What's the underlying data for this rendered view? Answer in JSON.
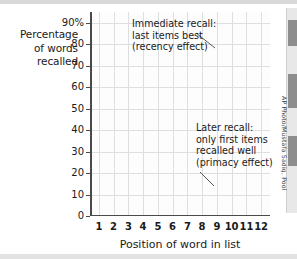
{
  "figure": {
    "y_axis_title_lines": [
      "Percentage",
      "of words",
      "recalled"
    ],
    "x_axis_title": "Position of word in list",
    "photo_credit": "AP Photo/Mustafa Sadiq, Pool"
  },
  "annotations": [
    {
      "id": "immediate",
      "lines": [
        "Immediate recall:",
        "last items best",
        "(recency effect)"
      ],
      "points_to_series": "Immediate recall"
    },
    {
      "id": "later",
      "lines": [
        "Later recall:",
        "only first items",
        "recalled well",
        "(primacy effect)"
      ],
      "points_to_series": "Later recall"
    }
  ],
  "chart_data": {
    "type": "line",
    "title": "",
    "xlabel": "Position of word in list",
    "ylabel": "Percentage of words recalled",
    "x": [
      1,
      2,
      3,
      4,
      5,
      6,
      7,
      8,
      9,
      10,
      11,
      12
    ],
    "categories": [
      "1",
      "2",
      "3",
      "4",
      "5",
      "6",
      "7",
      "8",
      "9",
      "10",
      "11",
      "12"
    ],
    "xlim": [
      0.4,
      12.6
    ],
    "ylim": [
      0,
      95
    ],
    "ytick_values": [
      0,
      10,
      20,
      30,
      40,
      50,
      60,
      70,
      80,
      90
    ],
    "ytick_labels": [
      "0",
      "10",
      "20",
      "30",
      "40",
      "50",
      "60",
      "70",
      "80",
      "90%"
    ],
    "grid": true,
    "legend": "none",
    "series": [
      {
        "name": "Immediate recall",
        "color": "#9a9a9a",
        "line_width": 5,
        "values": [
          70,
          61,
          52,
          43,
          31,
          30,
          32,
          24,
          86,
          85,
          90,
          84
        ]
      },
      {
        "name": "Later recall",
        "color": "#cccccc",
        "line_width": 5,
        "values": [
          42,
          36,
          29,
          22,
          15,
          18,
          19,
          16,
          19,
          13,
          13,
          11
        ]
      }
    ]
  },
  "colors": {
    "immediate_line": "#9a9a9a",
    "later_line": "#cccccc",
    "grid": "#dcdfe2",
    "axis": "#4a4a4a",
    "text": "#1a1a1a",
    "plot_background": "#fdfdfd"
  }
}
